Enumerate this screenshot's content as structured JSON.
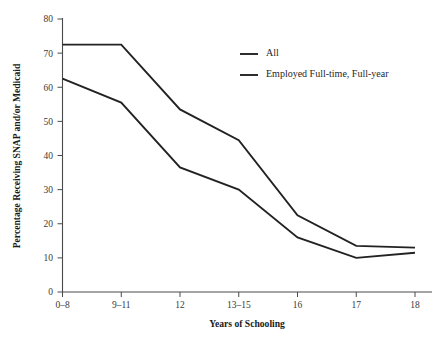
{
  "chart_data": {
    "type": "line",
    "title": "",
    "xlabel": "Years of Schooling",
    "ylabel": "Percentage Receiving SNAP and/or Medicaid",
    "categories": [
      "0–8",
      "9–11",
      "12",
      "13–15",
      "16",
      "17",
      "18"
    ],
    "series": [
      {
        "name": "All",
        "values": [
          72.5,
          72.5,
          53.5,
          44.5,
          22.5,
          13.5,
          13.0
        ]
      },
      {
        "name": "Employed Full-time, Full-year",
        "values": [
          62.5,
          55.5,
          36.5,
          30.0,
          16.0,
          10.0,
          11.5
        ]
      }
    ],
    "ylim": [
      0,
      80
    ],
    "yticks": [
      0,
      10,
      20,
      30,
      40,
      50,
      60,
      70,
      80
    ],
    "ytick_labels": [
      "0",
      "10",
      "20",
      "30",
      "40",
      "50",
      "60",
      "70",
      "80"
    ],
    "grid": false,
    "legend_position": "top-right",
    "line_color": "#222222",
    "axis_color": "#4a4a4a"
  },
  "legend": {
    "items": [
      {
        "label": "All"
      },
      {
        "label": "Employed Full-time, Full-year"
      }
    ]
  },
  "caption": {
    "text": ""
  }
}
